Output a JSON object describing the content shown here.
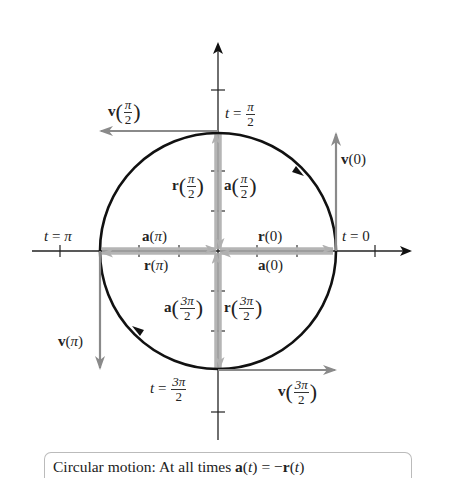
{
  "diagram": {
    "type": "circular-motion-vector-diagram",
    "colors": {
      "circle": "#111111",
      "axes": "#222222",
      "velocity_vectors": "#8a8a8a",
      "position_accel_vectors": "#b5b5b5"
    },
    "points": {
      "t0": {
        "t": "t",
        "eq": "=",
        "value": "0"
      },
      "t_pi_2": {
        "t": "t",
        "eq": "=",
        "num": "π",
        "den": "2"
      },
      "t_pi": {
        "t": "t",
        "eq": "=",
        "value": "π"
      },
      "t_3pi_2": {
        "t": "t",
        "eq": "=",
        "num": "3π",
        "den": "2"
      }
    },
    "vectors": {
      "v0": {
        "name": "v",
        "arg": "0"
      },
      "v_pi_2": {
        "name": "v",
        "num": "π",
        "den": "2"
      },
      "v_pi": {
        "name": "v",
        "arg": "π"
      },
      "v_3pi_2": {
        "name": "v",
        "num": "3π",
        "den": "2"
      },
      "r0": {
        "name": "r",
        "arg": "0"
      },
      "a0": {
        "name": "a",
        "arg": "0"
      },
      "r_pi": {
        "name": "r",
        "arg": "π"
      },
      "a_pi": {
        "name": "a",
        "arg": "π"
      },
      "r_pi_2": {
        "name": "r",
        "num": "π",
        "den": "2"
      },
      "a_pi_2": {
        "name": "a",
        "num": "π",
        "den": "2"
      },
      "r_3pi_2": {
        "name": "r",
        "num": "3π",
        "den": "2"
      },
      "a_3pi_2": {
        "name": "a",
        "num": "3π",
        "den": "2"
      }
    },
    "paren_open": "(",
    "paren_close": ")"
  },
  "caption": {
    "prefix": "Circular motion: At all times ",
    "a": "a",
    "t1": "t",
    "middle": " = −",
    "r": "r",
    "t2": "t",
    "open": "(",
    "close": ")"
  }
}
